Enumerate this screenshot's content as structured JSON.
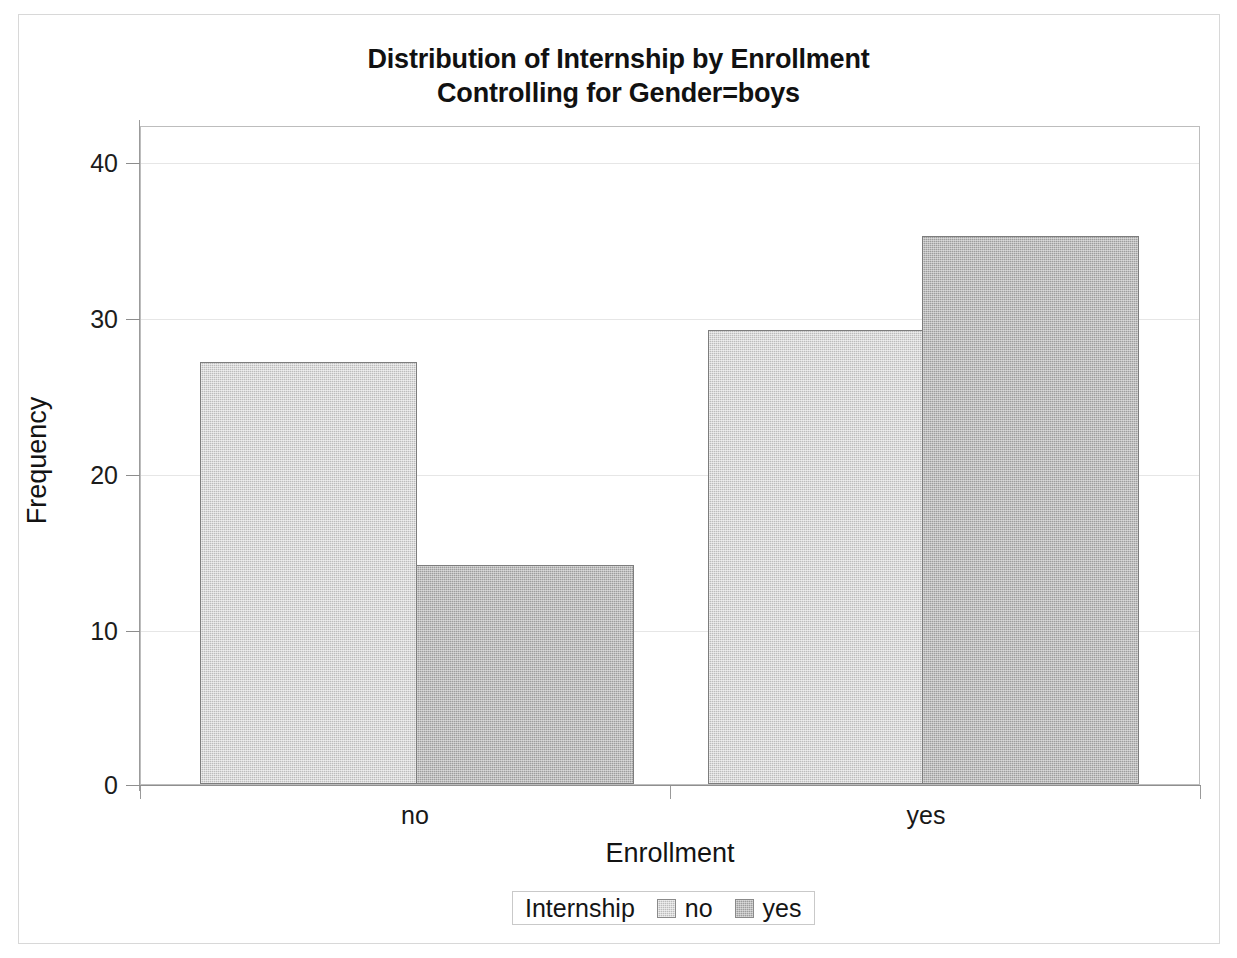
{
  "chart_data": {
    "type": "bar",
    "title": "Distribution of Internship by Enrollment",
    "subtitle": "Controlling for Gender=boys",
    "xlabel": "Enrollment",
    "ylabel": "Frequency",
    "categories": [
      "no",
      "yes"
    ],
    "series": [
      {
        "name": "no",
        "values": [
          27,
          29
        ]
      },
      {
        "name": "yes",
        "values": [
          14,
          35
        ]
      }
    ],
    "ylim": [
      0,
      42
    ],
    "yticks": [
      0,
      10,
      20,
      30,
      40
    ],
    "ytick_labels": [
      "0",
      "10",
      "20",
      "30",
      "40"
    ],
    "xtick_labels": [
      "no",
      "yes"
    ],
    "grid": true,
    "grid_axis": "y",
    "legend": {
      "title": "Internship",
      "position": "bottom",
      "entries": [
        {
          "label": "no",
          "color": "#bcbcbc"
        },
        {
          "label": "yes",
          "color": "#9d9d9d"
        }
      ]
    },
    "colors": {
      "series_no": "#bcbcbc",
      "series_yes": "#9d9d9d",
      "bar_border": "#7d7d7d",
      "gridline": "#e6e6e6",
      "axis": "#9b9b9b",
      "text": "#131313",
      "background": "#ffffff"
    }
  },
  "title": {
    "line1": "Distribution of Internship by Enrollment",
    "line2": "Controlling for Gender=boys"
  },
  "axes": {
    "y_title": "Frequency",
    "x_title": "Enrollment",
    "y_ticks": [
      "0",
      "10",
      "20",
      "30",
      "40"
    ],
    "x_ticks": [
      "no",
      "yes"
    ]
  },
  "legend": {
    "title": "Internship",
    "entry_no": "no",
    "entry_yes": "yes"
  }
}
